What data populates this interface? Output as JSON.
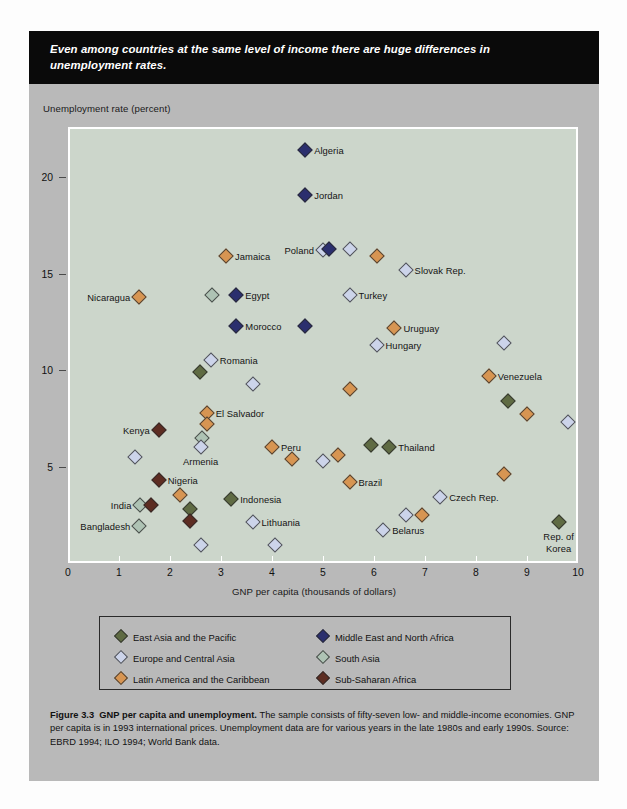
{
  "banner": {
    "text": "Even among countries at the same level of income there are huge differences in unemployment rates."
  },
  "axes": {
    "ylabel": "Unemployment rate (percent)",
    "xlabel": "GNP per capita (thousands of dollars)",
    "yticks": [
      5,
      10,
      15,
      20
    ],
    "xticks": [
      0,
      1,
      2,
      3,
      4,
      5,
      6,
      7,
      8,
      9,
      10
    ],
    "xlim": [
      0,
      10
    ],
    "ylim": [
      0,
      22.6
    ]
  },
  "legend": {
    "items": [
      {
        "label": "East Asia and the Pacific",
        "color": "#5f6b43"
      },
      {
        "label": "Europe and Central Asia",
        "color": "#ccd4ea"
      },
      {
        "label": "Latin America and the Caribbean",
        "color": "#d79552"
      },
      {
        "label": "Middle East and North Africa",
        "color": "#2b2f6e"
      },
      {
        "label": "South Asia",
        "color": "#aec3b4"
      },
      {
        "label": "Sub-Saharan Africa",
        "color": "#5d2d22"
      }
    ]
  },
  "caption": {
    "figure_number": "Figure 3.3",
    "title": "GNP per capita and unemployment.",
    "body": "The sample consists of fifty-seven low- and middle-income economies. GNP per capita is in 1993 international prices. Unemployment data are for various years in the late 1980s and early 1990s. Source: EBRD 1994; ILO 1994; World Bank data."
  },
  "chart_data": {
    "type": "scatter",
    "title": "GNP per capita and unemployment",
    "xlabel": "GNP per capita (thousands of dollars)",
    "ylabel": "Unemployment rate (percent)",
    "xlim": [
      0,
      10
    ],
    "ylim": [
      0,
      22.6
    ],
    "grid": false,
    "legend_position": "below-plot",
    "series": [
      {
        "name": "East Asia and the Pacific",
        "color": "#5f6b43"
      },
      {
        "name": "Europe and Central Asia",
        "color": "#ccd4ea"
      },
      {
        "name": "Latin America and the Caribbean",
        "color": "#d79552"
      },
      {
        "name": "Middle East and North Africa",
        "color": "#2b2f6e"
      },
      {
        "name": "South Asia",
        "color": "#aec3b4"
      },
      {
        "name": "Sub-Saharan Africa",
        "color": "#5d2d22"
      }
    ],
    "points": [
      {
        "label": "Algeria",
        "x": 4.65,
        "y": 21.4,
        "group": "Middle East and North Africa",
        "lpos": "l"
      },
      {
        "label": "Jordan",
        "x": 4.65,
        "y": 19.1,
        "group": "Middle East and North Africa",
        "lpos": "l"
      },
      {
        "label": "Jamaica",
        "x": 3.1,
        "y": 15.9,
        "group": "Latin America and the Caribbean",
        "lpos": "l"
      },
      {
        "label": "Poland",
        "x": 5.0,
        "y": 16.2,
        "group": "Europe and Central Asia",
        "lpos": "r"
      },
      {
        "label": "",
        "x": 5.12,
        "y": 16.3,
        "group": "Middle East and North Africa",
        "lpos": ""
      },
      {
        "label": "",
        "x": 5.52,
        "y": 16.3,
        "group": "Europe and Central Asia",
        "lpos": ""
      },
      {
        "label": "",
        "x": 6.05,
        "y": 15.9,
        "group": "Latin America and the Caribbean",
        "lpos": ""
      },
      {
        "label": "Slovak Rep.",
        "x": 6.62,
        "y": 15.2,
        "group": "Europe and Central Asia",
        "lpos": "l"
      },
      {
        "label": "Nicaragua",
        "x": 1.4,
        "y": 13.8,
        "group": "Latin America and the Caribbean",
        "lpos": "r"
      },
      {
        "label": "",
        "x": 2.82,
        "y": 13.9,
        "group": "South Asia",
        "lpos": ""
      },
      {
        "label": "Egypt",
        "x": 3.3,
        "y": 13.9,
        "group": "Middle East and North Africa",
        "lpos": "l"
      },
      {
        "label": "Turkey",
        "x": 5.52,
        "y": 13.9,
        "group": "Europe and Central Asia",
        "lpos": "l"
      },
      {
        "label": "Morocco",
        "x": 3.3,
        "y": 12.3,
        "group": "Middle East and North Africa",
        "lpos": "l"
      },
      {
        "label": "",
        "x": 4.65,
        "y": 12.3,
        "group": "Middle East and North Africa",
        "lpos": ""
      },
      {
        "label": "Uruguay",
        "x": 6.4,
        "y": 12.2,
        "group": "Latin America and the Caribbean",
        "lpos": "l"
      },
      {
        "label": "Romania",
        "x": 2.8,
        "y": 10.5,
        "group": "Europe and Central Asia",
        "lpos": "l"
      },
      {
        "label": "Hungary",
        "x": 6.05,
        "y": 11.3,
        "group": "Europe and Central Asia",
        "lpos": "l"
      },
      {
        "label": "",
        "x": 8.55,
        "y": 11.4,
        "group": "Europe and Central Asia",
        "lpos": ""
      },
      {
        "label": "",
        "x": 2.58,
        "y": 9.9,
        "group": "East Asia and the Pacific",
        "lpos": ""
      },
      {
        "label": "Venezuela",
        "x": 8.25,
        "y": 9.7,
        "group": "Latin America and the Caribbean",
        "lpos": "l"
      },
      {
        "label": "",
        "x": 3.62,
        "y": 9.3,
        "group": "Europe and Central Asia",
        "lpos": ""
      },
      {
        "label": "",
        "x": 5.52,
        "y": 9.0,
        "group": "Latin America and the Caribbean",
        "lpos": ""
      },
      {
        "label": "",
        "x": 8.62,
        "y": 8.4,
        "group": "East Asia and the Pacific",
        "lpos": ""
      },
      {
        "label": "El Salvador",
        "x": 2.72,
        "y": 7.8,
        "group": "Latin America and the Caribbean",
        "lpos": "l"
      },
      {
        "label": "",
        "x": 2.72,
        "y": 7.2,
        "group": "Latin America and the Caribbean",
        "lpos": ""
      },
      {
        "label": "",
        "x": 9.0,
        "y": 7.7,
        "group": "Latin America and the Caribbean",
        "lpos": ""
      },
      {
        "label": "Kenya",
        "x": 1.78,
        "y": 6.9,
        "group": "Sub-Saharan Africa",
        "lpos": "r"
      },
      {
        "label": "",
        "x": 2.62,
        "y": 6.5,
        "group": "South Asia",
        "lpos": ""
      },
      {
        "label": "Armenia",
        "x": 2.6,
        "y": 6.0,
        "group": "Europe and Central Asia",
        "lpos": "c"
      },
      {
        "label": "Peru",
        "x": 4.0,
        "y": 6.0,
        "group": "Latin America and the Caribbean",
        "lpos": "l"
      },
      {
        "label": "",
        "x": 9.8,
        "y": 7.3,
        "group": "Europe and Central Asia",
        "lpos": ""
      },
      {
        "label": "",
        "x": 1.32,
        "y": 5.5,
        "group": "Europe and Central Asia",
        "lpos": ""
      },
      {
        "label": "",
        "x": 4.4,
        "y": 5.4,
        "group": "Latin America and the Caribbean",
        "lpos": ""
      },
      {
        "label": "",
        "x": 5.0,
        "y": 5.3,
        "group": "Europe and Central Asia",
        "lpos": ""
      },
      {
        "label": "",
        "x": 5.3,
        "y": 5.6,
        "group": "Latin America and the Caribbean",
        "lpos": ""
      },
      {
        "label": "",
        "x": 5.95,
        "y": 6.1,
        "group": "East Asia and the Pacific",
        "lpos": ""
      },
      {
        "label": "Thailand",
        "x": 6.3,
        "y": 6.0,
        "group": "East Asia and the Pacific",
        "lpos": "l"
      },
      {
        "label": "Nigeria",
        "x": 1.78,
        "y": 4.3,
        "group": "Sub-Saharan Africa",
        "lpos": "l"
      },
      {
        "label": "Brazil",
        "x": 5.52,
        "y": 4.2,
        "group": "Latin America and the Caribbean",
        "lpos": "l"
      },
      {
        "label": "",
        "x": 8.55,
        "y": 4.6,
        "group": "Latin America and the Caribbean",
        "lpos": ""
      },
      {
        "label": "",
        "x": 2.2,
        "y": 3.5,
        "group": "Latin America and the Caribbean",
        "lpos": ""
      },
      {
        "label": "Indonesia",
        "x": 3.2,
        "y": 3.3,
        "group": "East Asia and the Pacific",
        "lpos": "l"
      },
      {
        "label": "India",
        "x": 1.42,
        "y": 3.0,
        "group": "South Asia",
        "lpos": "r"
      },
      {
        "label": "",
        "x": 1.62,
        "y": 3.0,
        "group": "Sub-Saharan Africa",
        "lpos": ""
      },
      {
        "label": "",
        "x": 2.4,
        "y": 2.8,
        "group": "East Asia and the Pacific",
        "lpos": ""
      },
      {
        "label": "Czech Rep.",
        "x": 7.3,
        "y": 3.4,
        "group": "Europe and Central Asia",
        "lpos": "l"
      },
      {
        "label": "",
        "x": 6.62,
        "y": 2.5,
        "group": "Europe and Central Asia",
        "lpos": ""
      },
      {
        "label": "",
        "x": 6.95,
        "y": 2.5,
        "group": "Latin America and the Caribbean",
        "lpos": ""
      },
      {
        "label": "",
        "x": 2.4,
        "y": 2.2,
        "group": "Sub-Saharan Africa",
        "lpos": ""
      },
      {
        "label": "Bangladesh",
        "x": 1.4,
        "y": 1.9,
        "group": "South Asia",
        "lpos": "r"
      },
      {
        "label": "Lithuania",
        "x": 3.62,
        "y": 2.1,
        "group": "Europe and Central Asia",
        "lpos": "l"
      },
      {
        "label": "Belarus",
        "x": 6.18,
        "y": 1.7,
        "group": "Europe and Central Asia",
        "lpos": "l"
      },
      {
        "label": "Rep. of Korea",
        "x": 9.62,
        "y": 2.1,
        "group": "East Asia and the Pacific",
        "lpos": "c"
      },
      {
        "label": "",
        "x": 2.6,
        "y": 0.95,
        "group": "Europe and Central Asia",
        "lpos": ""
      },
      {
        "label": "",
        "x": 4.05,
        "y": 0.95,
        "group": "Europe and Central Asia",
        "lpos": ""
      }
    ]
  }
}
